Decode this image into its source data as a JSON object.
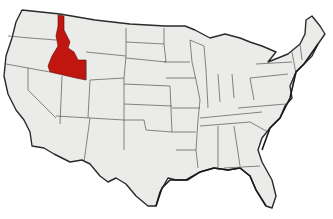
{
  "map": {
    "subject": "United States (contiguous 48 states)",
    "highlighted_state": "Idaho",
    "colors": {
      "highlight": "#c0160f",
      "land": "#ebebea",
      "border": "#555555",
      "background": "#ffffff"
    }
  }
}
